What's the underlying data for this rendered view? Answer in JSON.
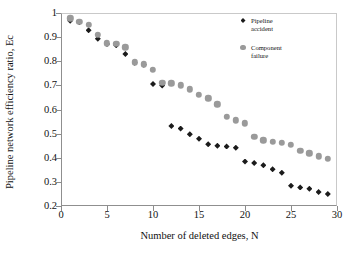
{
  "chart_data": {
    "type": "scatter",
    "title": "",
    "xlabel": "Number of deleted edges, N",
    "ylabel": "Pipeline network efficiency ratio, Ec",
    "xlim": [
      0,
      30
    ],
    "ylim": [
      0.2,
      1.0
    ],
    "xticks": [
      0,
      5,
      10,
      15,
      20,
      25,
      30
    ],
    "yticks": [
      "0.2",
      "0.3",
      "0.4",
      "0.5",
      "0.6",
      "0.7",
      "0.8",
      "0.9",
      "1"
    ],
    "grid": false,
    "legend_position": "top-right",
    "x": [
      1,
      2,
      3,
      4,
      5,
      6,
      7,
      8,
      9,
      10,
      11,
      12,
      13,
      14,
      15,
      16,
      17,
      18,
      19,
      20,
      21,
      22,
      23,
      24,
      25,
      26,
      27,
      28,
      29
    ],
    "series": [
      {
        "name": "Pipeline accident",
        "marker": "diamond",
        "color": "#1b1b1b",
        "values": [
          0.968,
          0.962,
          0.928,
          0.893,
          0.872,
          0.866,
          0.83,
          0.794,
          0.786,
          0.706,
          0.699,
          0.532,
          0.521,
          0.497,
          0.479,
          0.456,
          0.45,
          0.447,
          0.441,
          0.384,
          0.378,
          0.369,
          0.352,
          0.338,
          0.284,
          0.277,
          0.271,
          0.258,
          0.25
        ]
      },
      {
        "name": "Component failure",
        "marker": "circle",
        "color": "#9a9a9a",
        "values": [
          0.978,
          0.963,
          0.952,
          0.91,
          0.875,
          0.872,
          0.858,
          0.795,
          0.788,
          0.764,
          0.711,
          0.709,
          0.7,
          0.683,
          0.661,
          0.647,
          0.622,
          0.57,
          0.556,
          0.543,
          0.487,
          0.473,
          0.466,
          0.463,
          0.454,
          0.43,
          0.419,
          0.406,
          0.396
        ]
      }
    ]
  },
  "legend": {
    "entries": [
      {
        "label": "Pipeline\naccident",
        "marker": "diamond"
      },
      {
        "label": "Component\nfailure",
        "marker": "circle"
      }
    ]
  }
}
